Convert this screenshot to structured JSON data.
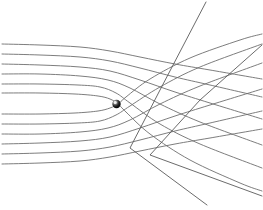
{
  "figure": {
    "title": "Deflection of parallel field lines by a central point mass",
    "width": 263,
    "height": 210,
    "background_color": "#ffffff"
  },
  "style": {
    "streamline_color": "#6e6e6e",
    "streamline_width": 0.9,
    "ray_color": "#5a5a5a",
    "ray_width": 0.9,
    "mass_fill": "#1a1a1a",
    "mass_highlight": "#f2f2f2"
  },
  "point_mass": {
    "label": "point-mass",
    "cx": 116.5,
    "cy": 104,
    "r": 4.2,
    "highlight_cx": 115.2,
    "highlight_cy": 102.4,
    "highlight_r": 1.5
  },
  "chart_data": {
    "type": "line",
    "title": "Deflection of parallel field lines by a central point mass",
    "xlabel": "",
    "ylabel": "",
    "xlim": [
      0,
      263
    ],
    "ylim": [
      0,
      210
    ],
    "grid": false,
    "legend": "none",
    "annotations": [
      {
        "name": "point-mass",
        "x": 116.5,
        "y": 104
      }
    ],
    "series": [
      {
        "name": "streamline-upper-6",
        "points": [
          [
            2,
            44
          ],
          [
            40,
            45
          ],
          [
            80,
            47
          ],
          [
            110,
            51
          ],
          [
            140,
            57
          ],
          [
            175,
            64
          ],
          [
            210,
            70
          ],
          [
            262,
            79
          ]
        ]
      },
      {
        "name": "streamline-upper-5",
        "points": [
          [
            2,
            54
          ],
          [
            40,
            55
          ],
          [
            80,
            57
          ],
          [
            110,
            61
          ],
          [
            140,
            68
          ],
          [
            175,
            77
          ],
          [
            210,
            85
          ],
          [
            262,
            97
          ]
        ]
      },
      {
        "name": "streamline-upper-4",
        "points": [
          [
            2,
            64
          ],
          [
            40,
            65
          ],
          [
            80,
            67
          ],
          [
            110,
            71
          ],
          [
            140,
            80
          ],
          [
            175,
            92
          ],
          [
            210,
            103
          ],
          [
            262,
            119
          ]
        ]
      },
      {
        "name": "streamline-upper-3",
        "points": [
          [
            2,
            74
          ],
          [
            40,
            74
          ],
          [
            80,
            76
          ],
          [
            108,
            80
          ],
          [
            130,
            88
          ],
          [
            160,
            104
          ],
          [
            200,
            122
          ],
          [
            262,
            145
          ]
        ]
      },
      {
        "name": "streamline-upper-2",
        "points": [
          [
            2,
            84
          ],
          [
            40,
            84
          ],
          [
            78,
            85
          ],
          [
            100,
            87
          ],
          [
            116,
            93
          ],
          [
            130,
            103
          ],
          [
            160,
            124
          ],
          [
            200,
            144
          ],
          [
            262,
            168
          ]
        ]
      },
      {
        "name": "streamline-upper-1",
        "points": [
          [
            2,
            93
          ],
          [
            40,
            93
          ],
          [
            75,
            94
          ],
          [
            98,
            96
          ],
          [
            110,
            99
          ],
          [
            118,
            104
          ],
          [
            126,
            112
          ],
          [
            150,
            134
          ],
          [
            190,
            160
          ],
          [
            240,
            183
          ],
          [
            262,
            191
          ]
        ]
      },
      {
        "name": "streamline-lower-1",
        "points": [
          [
            2,
            114
          ],
          [
            40,
            114
          ],
          [
            75,
            113
          ],
          [
            98,
            111
          ],
          [
            110,
            108
          ],
          [
            118,
            104
          ],
          [
            126,
            97
          ],
          [
            150,
            79
          ],
          [
            190,
            58
          ],
          [
            240,
            40
          ],
          [
            262,
            34
          ]
        ]
      },
      {
        "name": "streamline-lower-2",
        "points": [
          [
            2,
            124
          ],
          [
            40,
            124
          ],
          [
            78,
            123
          ],
          [
            100,
            121
          ],
          [
            116,
            115
          ],
          [
            130,
            106
          ],
          [
            160,
            87
          ],
          [
            200,
            67
          ],
          [
            262,
            44
          ]
        ]
      },
      {
        "name": "streamline-lower-3",
        "points": [
          [
            2,
            134
          ],
          [
            40,
            134
          ],
          [
            80,
            132
          ],
          [
            108,
            128
          ],
          [
            130,
            120
          ],
          [
            160,
            104
          ],
          [
            200,
            86
          ],
          [
            262,
            63
          ]
        ]
      },
      {
        "name": "streamline-lower-4",
        "points": [
          [
            2,
            144
          ],
          [
            40,
            143
          ],
          [
            80,
            141
          ],
          [
            110,
            137
          ],
          [
            140,
            128
          ],
          [
            175,
            116
          ],
          [
            210,
            105
          ],
          [
            262,
            89
          ]
        ]
      },
      {
        "name": "streamline-lower-5",
        "points": [
          [
            2,
            154
          ],
          [
            40,
            153
          ],
          [
            80,
            151
          ],
          [
            110,
            147
          ],
          [
            140,
            140
          ],
          [
            175,
            131
          ],
          [
            210,
            123
          ],
          [
            262,
            111
          ]
        ]
      },
      {
        "name": "streamline-lower-6",
        "points": [
          [
            2,
            164
          ],
          [
            40,
            163
          ],
          [
            80,
            161
          ],
          [
            110,
            157
          ],
          [
            140,
            151
          ],
          [
            175,
            144
          ],
          [
            210,
            138
          ],
          [
            262,
            129
          ]
        ]
      },
      {
        "name": "ray-steep",
        "points": [
          [
            206,
            2
          ],
          [
            160,
            90
          ],
          [
            130,
            148
          ],
          [
            207,
            205
          ]
        ]
      },
      {
        "name": "ray-shallow",
        "points": [
          [
            262,
            45
          ],
          [
            200,
            100
          ],
          [
            150,
            155
          ],
          [
            262,
            196
          ]
        ]
      }
    ]
  },
  "rays": [
    {
      "name": "ray-steep-descending",
      "x1": 206,
      "y1": 2,
      "x2": 131,
      "y2": 148
    },
    {
      "name": "ray-steep-ascending",
      "x1": 131,
      "y1": 148,
      "x2": 208,
      "y2": 206
    },
    {
      "name": "ray-shallow-descending",
      "x1": 262,
      "y1": 45,
      "x2": 152,
      "y2": 156
    },
    {
      "name": "ray-shallow-ascending",
      "x1": 152,
      "y1": 156,
      "x2": 262,
      "y2": 196
    }
  ]
}
